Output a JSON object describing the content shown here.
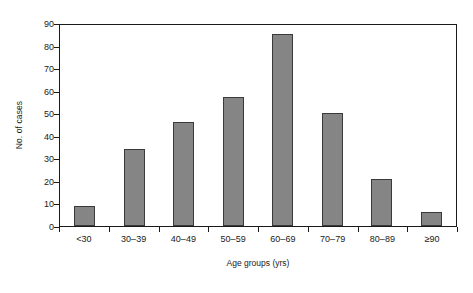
{
  "chart_data": {
    "type": "bar",
    "title": "",
    "subtitle": "",
    "xlabel": "Age groups (yrs)",
    "ylabel": "No. of cases",
    "categories": [
      "<30",
      "30–39",
      "40–49",
      "50–59",
      "60–69",
      "70–79",
      "80–89",
      "≥90"
    ],
    "values": [
      9,
      34,
      46,
      57,
      85,
      50,
      21,
      6
    ],
    "ylim": [
      0,
      90
    ],
    "yticks": [
      0,
      10,
      20,
      30,
      40,
      50,
      60,
      70,
      80,
      90
    ],
    "ytick_labels": [
      "0",
      "10",
      "20",
      "30",
      "40",
      "50",
      "60",
      "70",
      "80",
      "90"
    ],
    "grid": false,
    "legend": null,
    "legend_position": "none",
    "bar_color": "#858585",
    "bar_edge_color": "#3a3a3a",
    "axis_color": "#1a1a1a",
    "background": "#ffffff",
    "annotations": []
  }
}
